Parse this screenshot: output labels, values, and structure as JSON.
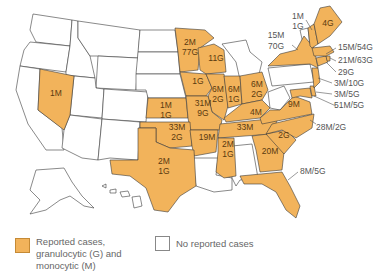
{
  "colors": {
    "reported": "#f2b35b",
    "no_reported": "#ffffff",
    "border": "#3a3a3a",
    "label_text": "#5a3a10",
    "callout_text": "#555555"
  },
  "states": {
    "nevada": "1M",
    "minnesota": [
      "2M",
      "77G"
    ],
    "wisconsin": "11G",
    "iowa": "1G",
    "kansas": [
      "1M",
      "1G"
    ],
    "missouri": [
      "31M",
      "9G"
    ],
    "illinois": [
      "6M",
      "2G"
    ],
    "indiana": [
      "6M",
      "1G"
    ],
    "ohio": [
      "6M",
      "2G"
    ],
    "kentucky": "4M",
    "tennessee": "33M",
    "oklahoma": [
      "33M",
      "2G"
    ],
    "arkansas": "19M",
    "mississippi": [
      "2M",
      "1G"
    ],
    "texas": [
      "2M",
      "1G"
    ],
    "georgia": "20M",
    "south_carolina": "2G",
    "virginia": "9M",
    "maine": "4G"
  },
  "callouts": {
    "new_hampshire": [
      "1M",
      "1G"
    ],
    "new_york": [
      "15M",
      "70G"
    ],
    "massachusetts": "15M/54G",
    "connecticut": "21M/63G",
    "rhode_island": "29G",
    "new_jersey": "3M/10G",
    "delaware": "3M/5G",
    "maryland": "51M/5G",
    "north_carolina": "28M/2G",
    "florida": "8M/5G"
  },
  "legend": {
    "reported_label": "Reported cases, granulocytic (G) and monocytic (M)",
    "reported_lines": [
      "Reported cases,",
      "granulocytic (G) and",
      "monocytic (M)"
    ],
    "none_label": "No reported cases"
  }
}
